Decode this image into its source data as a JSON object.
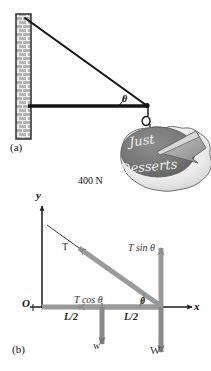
{
  "figure": {
    "panels": [
      {
        "id": "a",
        "label": "(a)",
        "description": "Physical setup: brick wall, horizontal boom, cable, hanging sign"
      },
      {
        "id": "b",
        "label": "(b)",
        "description": "Free-body diagram of the boom with force components"
      }
    ]
  },
  "panel_a": {
    "label": "(a)",
    "angle_label": "θ",
    "weight_label": "400 N",
    "sign": {
      "line1": "Just",
      "line2": "Desserts",
      "shape": "pie-with-slice"
    },
    "wall": {
      "name": "brick-wall",
      "pattern": "brick"
    },
    "members": [
      "cable",
      "boom",
      "hook"
    ]
  },
  "panel_b": {
    "label": "(b)",
    "axes": {
      "y_label": "y",
      "x_label": "x",
      "origin_label": "O"
    },
    "vectors": [
      {
        "name": "tension",
        "label": "T"
      },
      {
        "name": "tension-vertical-component",
        "label": "T sin θ"
      },
      {
        "name": "tension-horizontal-component",
        "label": "T cos θ"
      },
      {
        "name": "boom-weight",
        "label": "w"
      },
      {
        "name": "sign-weight",
        "label": "W"
      }
    ],
    "angle_label": "θ",
    "dimensions": [
      {
        "name": "half-length-left",
        "label": "L/2"
      },
      {
        "name": "half-length-right",
        "label": "L/2"
      }
    ]
  },
  "colors": {
    "line": "#1a1a1a",
    "vector_gray": "#8c8c8c",
    "vector_dark_gray": "#6e6e6e",
    "wall_fill": "#b9b9b9",
    "wall_mortar": "#e8e8e8",
    "pie_crust": "#f2f2f2",
    "pie_filling": "#7a7a7a",
    "pie_slice": "#9a9a9a",
    "background": "#ffffff"
  }
}
